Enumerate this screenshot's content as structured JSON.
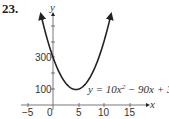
{
  "problem_number": "23.",
  "chart_data": {
    "type": "line",
    "title": "",
    "equation": "y = 10x² − 90x + 300",
    "equation_parts": {
      "pre": "y = 10x",
      "exp": "2",
      "post": " − 90x + 300"
    },
    "xlabel": "x",
    "ylabel": "y",
    "xlim": [
      -6,
      18
    ],
    "ylim": [
      0,
      500
    ],
    "x_ticks": [
      -5,
      0,
      5,
      10,
      15
    ],
    "x_tick_labels": [
      "−5",
      "0",
      "5",
      "10",
      "15"
    ],
    "y_ticks": [
      100,
      300
    ],
    "y_tick_labels": [
      "100",
      "300"
    ],
    "grid": false,
    "series": [
      {
        "name": "y = 10x^2 - 90x + 300",
        "x": [
          -2,
          -1,
          0,
          1,
          2,
          3,
          4,
          4.5,
          5,
          6,
          7,
          8,
          9,
          10,
          11
        ],
        "y": [
          520,
          400,
          300,
          220,
          160,
          120,
          100,
          97.5,
          100,
          120,
          160,
          220,
          300,
          400,
          520
        ]
      }
    ],
    "vertex": [
      4.5,
      97.5
    ],
    "color": "#222222"
  }
}
